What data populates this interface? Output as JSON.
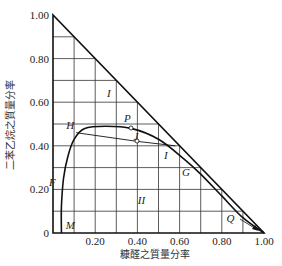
{
  "chart_data": {
    "type": "ternary-phase-diagram",
    "xlabel": "糠醛之質量分率",
    "ylabel": "二苯乙烷之質量分率",
    "x_ticks": [
      "0.20",
      "0.40",
      "0.60",
      "0.80",
      "1.00"
    ],
    "y_ticks": [
      "0",
      "0.20",
      "0.40",
      "0.60",
      "0.80",
      "1.00"
    ],
    "grid_step": 0.1,
    "regions": [
      {
        "label": "I",
        "x": 0.27,
        "y": 0.64
      },
      {
        "label": "I",
        "x": 0.54,
        "y": 0.36
      },
      {
        "label": "II",
        "x": 0.43,
        "y": 0.15
      }
    ],
    "points": [
      {
        "label": "H",
        "x": 0.11,
        "y": 0.47
      },
      {
        "label": "P",
        "x": 0.37,
        "y": 0.48
      },
      {
        "label": "J",
        "x": 0.4,
        "y": 0.42
      },
      {
        "label": "G",
        "x": 0.64,
        "y": 0.3
      },
      {
        "label": "F",
        "x": 0.01,
        "y": 0.23
      },
      {
        "label": "M",
        "x": 0.06,
        "y": 0.02
      },
      {
        "label": "Q",
        "x": 0.86,
        "y": 0.05
      }
    ],
    "binodal_curve": [
      [
        0.04,
        0.0
      ],
      [
        0.04,
        0.12
      ],
      [
        0.05,
        0.25
      ],
      [
        0.07,
        0.35
      ],
      [
        0.1,
        0.43
      ],
      [
        0.15,
        0.48
      ],
      [
        0.25,
        0.49
      ],
      [
        0.37,
        0.48
      ],
      [
        0.5,
        0.43
      ],
      [
        0.62,
        0.34
      ],
      [
        0.7,
        0.27
      ],
      [
        0.8,
        0.17
      ],
      [
        0.9,
        0.07
      ],
      [
        1.0,
        0.0
      ]
    ],
    "tie_line": [
      [
        0.11,
        0.46
      ],
      [
        0.4,
        0.42
      ],
      [
        0.58,
        0.4
      ]
    ],
    "grid": true
  }
}
